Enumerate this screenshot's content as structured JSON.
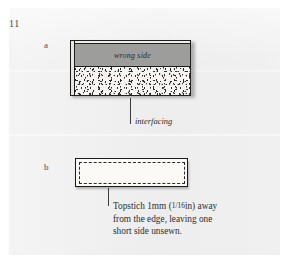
{
  "page": {
    "figure_number": "11",
    "background_color": "#eeeeee",
    "margin_color": "#ffffff"
  },
  "diagrams": [
    {
      "id": "a",
      "label": "a",
      "annotations": {
        "inner_label": "wrong side",
        "leader_label": "interfacing"
      },
      "colors": {
        "wrong_side_fill": "#9d9d9b",
        "interfacing_fill": "#f6f5f1",
        "outline": "#20201e"
      }
    },
    {
      "id": "b",
      "label": "b",
      "caption": {
        "line1_pre": "Topstich 1mm (",
        "line1_fraction": "1/16",
        "line1_post": "in) away",
        "line2": "from the edge, leaving one",
        "line3": "short side unsewn.",
        "full_text": "Topstich 1mm (1/16in) away from the edge, leaving one short side unsewn."
      },
      "colors": {
        "body_fill": "#fbfaf7",
        "outline": "#1b1b1b",
        "stitch_line": "#2a2a2a"
      }
    }
  ]
}
